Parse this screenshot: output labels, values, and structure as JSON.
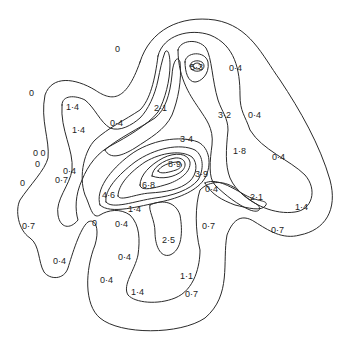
{
  "diagram": {
    "type": "contour-map",
    "stroke_color": "#2a2a2a",
    "label_color": "#1e1e1e",
    "background": "#ffffff",
    "labels": [
      {
        "text": "0",
        "x": 115,
        "y": 52
      },
      {
        "text": "5·3",
        "x": 197,
        "y": 70
      },
      {
        "text": "0·4",
        "x": 231,
        "y": 71
      },
      {
        "text": "0",
        "x": 31,
        "y": 96
      },
      {
        "text": "1·4",
        "x": 69,
        "y": 110
      },
      {
        "text": "2·1",
        "x": 157,
        "y": 111
      },
      {
        "text": "0·4",
        "x": 111,
        "y": 126
      },
      {
        "text": "1·4",
        "x": 74,
        "y": 133
      },
      {
        "text": "3·2",
        "x": 219,
        "y": 118
      },
      {
        "text": "0·4",
        "x": 250,
        "y": 118
      },
      {
        "text": "3·4",
        "x": 183,
        "y": 142
      },
      {
        "text": "0 0",
        "x": 34,
        "y": 156
      },
      {
        "text": "0",
        "x": 36,
        "y": 167
      },
      {
        "text": "1·8",
        "x": 235,
        "y": 154
      },
      {
        "text": "0·4",
        "x": 272,
        "y": 160
      },
      {
        "text": "0·4",
        "x": 65,
        "y": 174
      },
      {
        "text": "8·9",
        "x": 171,
        "y": 166
      },
      {
        "text": "0",
        "x": 21,
        "y": 186
      },
      {
        "text": "0·7",
        "x": 56,
        "y": 183
      },
      {
        "text": "6·8",
        "x": 142,
        "y": 188
      },
      {
        "text": "3·9",
        "x": 197,
        "y": 177
      },
      {
        "text": "4·6",
        "x": 103,
        "y": 198
      },
      {
        "text": "0·4",
        "x": 207,
        "y": 192
      },
      {
        "text": "2·1",
        "x": 251,
        "y": 199
      },
      {
        "text": "1·4",
        "x": 296,
        "y": 209
      },
      {
        "text": "1·4",
        "x": 129,
        "y": 212
      },
      {
        "text": "0",
        "x": 94,
        "y": 225
      },
      {
        "text": "0·4",
        "x": 118,
        "y": 227
      },
      {
        "text": "0·7",
        "x": 24,
        "y": 228
      },
      {
        "text": "0·7",
        "x": 203,
        "y": 229
      },
      {
        "text": "0·7",
        "x": 272,
        "y": 232
      },
      {
        "text": "2·5",
        "x": 163,
        "y": 242
      },
      {
        "text": "0·4",
        "x": 120,
        "y": 259
      },
      {
        "text": "0·4",
        "x": 54,
        "y": 262
      },
      {
        "text": "0·4",
        "x": 101,
        "y": 282
      },
      {
        "text": "1·1",
        "x": 181,
        "y": 278
      },
      {
        "text": "0·4",
        "x": 100,
        "y": 283
      },
      {
        "text": "1·4",
        "x": 130,
        "y": 295
      },
      {
        "text": "0·7",
        "x": 185,
        "y": 296
      }
    ]
  }
}
